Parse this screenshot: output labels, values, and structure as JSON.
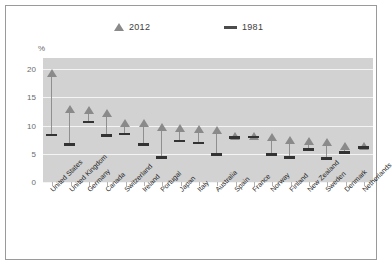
{
  "chart_data": {
    "type": "scatter",
    "title": "",
    "xlabel": "",
    "ylabel": "%",
    "ylim": [
      0,
      22
    ],
    "yticks": [
      0,
      5,
      10,
      15,
      20
    ],
    "grid": true,
    "legend_position": "top",
    "categories": [
      "United States",
      "United Kingdom",
      "Germany",
      "Canada",
      "Switzerland",
      "Ireland",
      "Portugal",
      "Japan",
      "Italy",
      "Australia",
      "Spain",
      "France",
      "Norway",
      "Finland",
      "New Zealand",
      "Sweden",
      "Denmark",
      "Netherlands"
    ],
    "series": [
      {
        "name": "2012",
        "marker": "triangle",
        "color": "#8a8a8a",
        "values": [
          19.4,
          12.9,
          12.7,
          12.2,
          10.5,
          10.5,
          9.7,
          9.5,
          9.4,
          9.2,
          8.1,
          8.1,
          7.9,
          7.4,
          7.3,
          7.1,
          6.4,
          6.3
        ]
      },
      {
        "name": "1981",
        "marker": "dash",
        "color": "#333333",
        "values": [
          8.4,
          6.7,
          10.7,
          8.3,
          8.6,
          6.7,
          4.4,
          7.3,
          7.0,
          4.9,
          7.9,
          8.0,
          4.9,
          4.4,
          5.8,
          4.2,
          5.3,
          6.2
        ]
      }
    ]
  },
  "legend": {
    "items": [
      {
        "label": "2012",
        "marker": "triangle-marker"
      },
      {
        "label": "1981",
        "marker": "dash-marker"
      }
    ]
  },
  "axis": {
    "unit_label": "%",
    "y_ticks": [
      "0",
      "5",
      "10",
      "15",
      "20"
    ]
  },
  "colors": {
    "plot_background": "#d2d2d2",
    "gridline": "#f4f4f4",
    "series_2012": "#8a8a8a",
    "series_1981": "#333333",
    "frame_border": "#9a9a9a",
    "tick_label": "#6b6b6b",
    "category_label": "#1f1f1f"
  }
}
